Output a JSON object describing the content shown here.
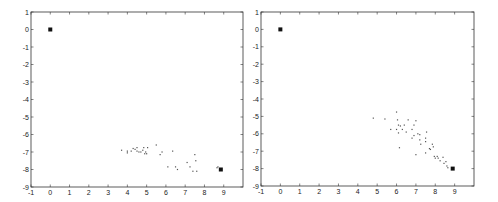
{
  "chart_data": [
    {
      "type": "scatter",
      "title": "",
      "xlabel": "",
      "ylabel": "",
      "xlim": [
        -1,
        10
      ],
      "ylim": [
        -9,
        1
      ],
      "xticks": [
        "-1",
        "0",
        "1",
        "2",
        "3",
        "4",
        "5",
        "6",
        "7",
        "8",
        "9"
      ],
      "yticks": [
        "1",
        "0",
        "-1",
        "-2",
        "-3",
        "-4",
        "-5",
        "-6",
        "-7",
        "-8",
        "-9"
      ],
      "grid": false,
      "legend": null,
      "series": [
        {
          "name": "start",
          "marker": "square",
          "points": [
            [
              0,
              0
            ]
          ]
        },
        {
          "name": "goal",
          "marker": "square",
          "points": [
            [
              8.85,
              -8.0
            ]
          ]
        },
        {
          "name": "samples",
          "marker": "dot",
          "points": [
            [
              3.7,
              -6.9
            ],
            [
              4.0,
              -7.05
            ],
            [
              4.0,
              -6.95
            ],
            [
              4.2,
              -6.95
            ],
            [
              4.3,
              -6.8
            ],
            [
              4.4,
              -6.85
            ],
            [
              4.5,
              -6.75
            ],
            [
              4.5,
              -6.95
            ],
            [
              4.6,
              -7.0
            ],
            [
              4.7,
              -7.0
            ],
            [
              4.8,
              -6.9
            ],
            [
              4.85,
              -6.75
            ],
            [
              4.9,
              -7.1
            ],
            [
              4.95,
              -7.0
            ],
            [
              5.0,
              -7.1
            ],
            [
              5.05,
              -6.75
            ],
            [
              5.5,
              -6.6
            ],
            [
              5.7,
              -7.15
            ],
            [
              5.8,
              -7.0
            ],
            [
              6.35,
              -6.95
            ],
            [
              6.1,
              -7.85
            ],
            [
              6.5,
              -7.85
            ],
            [
              6.6,
              -8.0
            ],
            [
              7.1,
              -7.6
            ],
            [
              7.25,
              -7.85
            ],
            [
              7.4,
              -8.1
            ],
            [
              7.5,
              -7.15
            ],
            [
              7.55,
              -7.5
            ],
            [
              7.6,
              -8.1
            ],
            [
              8.65,
              -7.9
            ],
            [
              8.7,
              -7.85
            ]
          ]
        }
      ]
    },
    {
      "type": "scatter",
      "title": "",
      "xlabel": "",
      "ylabel": "",
      "xlim": [
        -1,
        10
      ],
      "ylim": [
        -9,
        1
      ],
      "xticks": [
        "-1",
        "0",
        "1",
        "2",
        "3",
        "4",
        "5",
        "6",
        "7",
        "8",
        "9"
      ],
      "yticks": [
        "1",
        "0",
        "-1",
        "-2",
        "-3",
        "-4",
        "-5",
        "-6",
        "-7",
        "-8",
        "-9"
      ],
      "grid": false,
      "legend": null,
      "series": [
        {
          "name": "start",
          "marker": "square",
          "points": [
            [
              0,
              0
            ]
          ]
        },
        {
          "name": "goal",
          "marker": "square",
          "points": [
            [
              8.9,
              -8.0
            ]
          ]
        },
        {
          "name": "samples",
          "marker": "dot",
          "points": [
            [
              4.8,
              -5.1
            ],
            [
              5.4,
              -5.15
            ],
            [
              5.7,
              -5.75
            ],
            [
              6.0,
              -4.75
            ],
            [
              6.0,
              -5.75
            ],
            [
              6.05,
              -5.2
            ],
            [
              6.1,
              -5.5
            ],
            [
              6.1,
              -5.95
            ],
            [
              6.2,
              -5.55
            ],
            [
              6.3,
              -5.75
            ],
            [
              6.4,
              -5.5
            ],
            [
              6.5,
              -5.9
            ],
            [
              6.6,
              -5.2
            ],
            [
              6.15,
              -6.8
            ],
            [
              6.8,
              -5.75
            ],
            [
              6.8,
              -6.25
            ],
            [
              6.9,
              -5.5
            ],
            [
              6.9,
              -6.1
            ],
            [
              7.0,
              -5.25
            ],
            [
              7.0,
              -7.2
            ],
            [
              7.1,
              -6.0
            ],
            [
              7.2,
              -6.05
            ],
            [
              7.2,
              -6.35
            ],
            [
              7.25,
              -6.6
            ],
            [
              7.5,
              -6.25
            ],
            [
              7.5,
              -6.45
            ],
            [
              7.55,
              -5.9
            ],
            [
              7.5,
              -7.1
            ],
            [
              7.7,
              -6.85
            ],
            [
              7.75,
              -6.9
            ],
            [
              7.85,
              -6.6
            ],
            [
              7.9,
              -6.75
            ],
            [
              7.95,
              -7.3
            ],
            [
              8.0,
              -7.4
            ],
            [
              8.1,
              -7.3
            ],
            [
              8.15,
              -7.4
            ],
            [
              8.25,
              -7.55
            ],
            [
              8.4,
              -7.35
            ],
            [
              8.45,
              -7.7
            ],
            [
              8.55,
              -7.6
            ],
            [
              8.6,
              -7.85
            ],
            [
              8.65,
              -7.95
            ]
          ]
        }
      ]
    }
  ]
}
